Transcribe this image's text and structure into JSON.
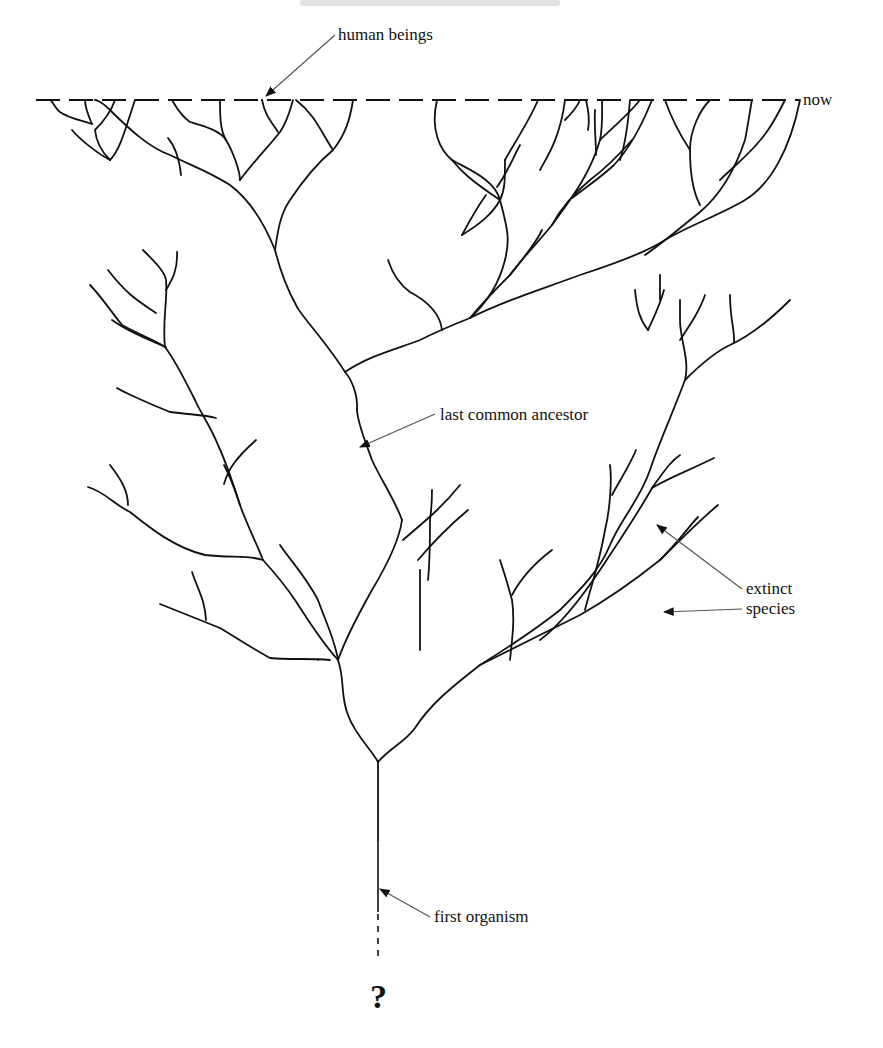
{
  "page": {
    "header_ghost_text": "",
    "background": "#ffffff",
    "ink_color": "#111111"
  },
  "diagram": {
    "type": "phylogenetic-tree",
    "labels": {
      "human_beings": "human beings",
      "now": "now",
      "last_common_ancestor": "last common ancestor",
      "extinct_line1": "extinct",
      "extinct_line2": "species",
      "first_organism": "first organism",
      "question_mark": "?"
    },
    "present_line": {
      "y": 100,
      "x_start": 36,
      "x_end": 800,
      "style": "dashed"
    }
  }
}
